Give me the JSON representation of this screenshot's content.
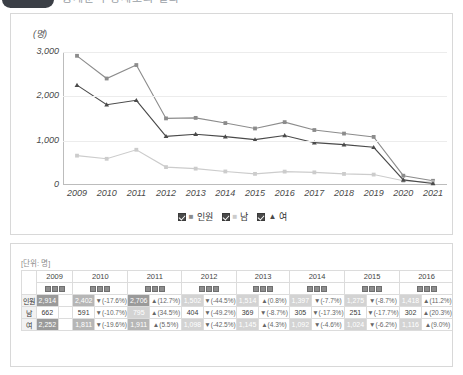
{
  "header": {
    "badge_label": "",
    "title": "통계분석 상세조회 결과"
  },
  "chart": {
    "y_unit": "(명)",
    "y_ticks": [
      "3,000",
      "2,000",
      "1,000",
      "0"
    ],
    "y_tick_values": [
      3000,
      2000,
      1000,
      0
    ],
    "legend": [
      {
        "label": "인원",
        "marker": "■",
        "checked": "true"
      },
      {
        "label": "남",
        "marker": "■",
        "checked": "true"
      },
      {
        "label": "여",
        "marker": "▲",
        "checked": "true"
      }
    ]
  },
  "chart_data": {
    "type": "line",
    "title": "",
    "xlabel": "",
    "ylabel": "(명)",
    "ylim": [
      0,
      3000
    ],
    "grid": true,
    "legend_position": "bottom",
    "x": [
      "2009",
      "2010",
      "2011",
      "2012",
      "2013",
      "2014",
      "2015",
      "2016",
      "2017",
      "2018",
      "2019",
      "2020",
      "2021"
    ],
    "series": [
      {
        "name": "인원",
        "marker": "square",
        "color": "#8c8c8c",
        "values": [
          2914,
          2402,
          2706,
          1502,
          1514,
          1397,
          1275,
          1418,
          1240,
          1160,
          1085,
          210,
          95
        ]
      },
      {
        "name": "남",
        "marker": "square",
        "color": "#cccccc",
        "values": [
          662,
          591,
          795,
          404,
          369,
          305,
          251,
          302,
          285,
          250,
          235,
          95,
          60
        ]
      },
      {
        "name": "여",
        "marker": "triangle",
        "color": "#4a4a4a",
        "values": [
          2252,
          1811,
          1911,
          1098,
          1145,
          1092,
          1024,
          1116,
          955,
          910,
          850,
          115,
          35
        ]
      }
    ]
  },
  "table": {
    "unit_label": "[단위: 명]",
    "columns": [
      "2009",
      "2010",
      "2011",
      "2012",
      "2013",
      "2014",
      "2015",
      "2016"
    ],
    "icon_count": 3,
    "rows": [
      {
        "label": "인원",
        "cells": [
          {
            "value": "2,914",
            "pct": "",
            "hl": "hl-dark"
          },
          {
            "value": "2,402",
            "pct": "▼(-17.6%)",
            "hl": "hl-mid"
          },
          {
            "value": "2,706",
            "pct": "▲(12.7%)",
            "hl": "hl-dark"
          },
          {
            "value": "1,502",
            "pct": "▼(-44.5%)",
            "hl": "hl-light"
          },
          {
            "value": "1,514",
            "pct": "▲(0.8%)",
            "hl": "hl-light"
          },
          {
            "value": "1,397",
            "pct": "▼(-7.7%)",
            "hl": "hl-light"
          },
          {
            "value": "1,275",
            "pct": "▼(-8.7%)",
            "hl": "hl-light"
          },
          {
            "value": "1,418",
            "pct": "▲(11.2%)",
            "hl": "hl-light"
          }
        ]
      },
      {
        "label": "남",
        "cells": [
          {
            "value": "662",
            "pct": "",
            "hl": "hl-none"
          },
          {
            "value": "591",
            "pct": "▼(-10.7%)",
            "hl": "hl-none"
          },
          {
            "value": "795",
            "pct": "▲(34.5%)",
            "hl": "hl-light"
          },
          {
            "value": "404",
            "pct": "▼(-49.2%)",
            "hl": "hl-none"
          },
          {
            "value": "369",
            "pct": "▼(-8.7%)",
            "hl": "hl-none"
          },
          {
            "value": "305",
            "pct": "▼(-17.3%)",
            "hl": "hl-none"
          },
          {
            "value": "251",
            "pct": "▼(-17.7%)",
            "hl": "hl-none"
          },
          {
            "value": "302",
            "pct": "▲(20.3%)",
            "hl": "hl-none"
          }
        ]
      },
      {
        "label": "여",
        "cells": [
          {
            "value": "2,252",
            "pct": "",
            "hl": "hl-dark"
          },
          {
            "value": "1,811",
            "pct": "▼(-19.6%)",
            "hl": "hl-mid"
          },
          {
            "value": "1,911",
            "pct": "▲(5.5%)",
            "hl": "hl-mid"
          },
          {
            "value": "1,098",
            "pct": "▼(-42.5%)",
            "hl": "hl-light"
          },
          {
            "value": "1,145",
            "pct": "▲(4.3%)",
            "hl": "hl-light"
          },
          {
            "value": "1,092",
            "pct": "▼(-4.6%)",
            "hl": "hl-light"
          },
          {
            "value": "1,024",
            "pct": "▼(-6.2%)",
            "hl": "hl-light"
          },
          {
            "value": "1,116",
            "pct": "▲(9.0%)",
            "hl": "hl-light"
          }
        ]
      }
    ]
  }
}
